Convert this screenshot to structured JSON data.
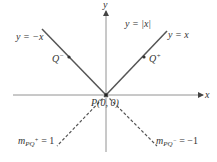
{
  "diagram": {
    "axes": {
      "x_label": "x",
      "y_label": "y",
      "color": "#555555"
    },
    "curve_label": "y = |x|",
    "lines": {
      "pos": {
        "label": "y = x",
        "style": "solid"
      },
      "neg": {
        "label": "y = −x",
        "style": "solid"
      },
      "secant_pos": {
        "label_m": "m",
        "label_sub": "PQ",
        "label_sup": "+",
        "label_value": " = 1",
        "style": "dashed"
      },
      "secant_neg": {
        "label_m": "m",
        "label_sub": "PQ",
        "label_sup": "−",
        "label_value": " = −1",
        "style": "dashed"
      }
    },
    "points": {
      "origin": {
        "label": "P(0, 0)"
      },
      "q_minus": {
        "label": "Q",
        "sup": "−"
      },
      "q_plus": {
        "label": "Q",
        "sup": "+"
      }
    },
    "colors": {
      "line": "#555555",
      "text": "#333333",
      "point": "#333333"
    }
  }
}
